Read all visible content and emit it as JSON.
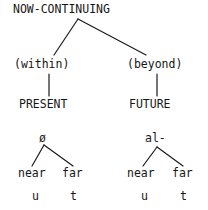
{
  "diagram": {
    "background_color": "#ffffff",
    "ink_color": "#161616",
    "root": {
      "label": "NOW-CONTINUING"
    },
    "tier2": {
      "left_label": "(within)",
      "right_label": "(beyond)"
    },
    "tier3": {
      "left_label": "PRESENT",
      "right_label": "FUTURE"
    },
    "subtrees": [
      {
        "root_label": "ø",
        "leaves": [
          "near",
          "far"
        ],
        "terminals": [
          "u",
          "t"
        ]
      },
      {
        "root_label": "al-",
        "leaves": [
          "near",
          "far"
        ],
        "terminals": [
          "u",
          "t"
        ]
      }
    ]
  }
}
